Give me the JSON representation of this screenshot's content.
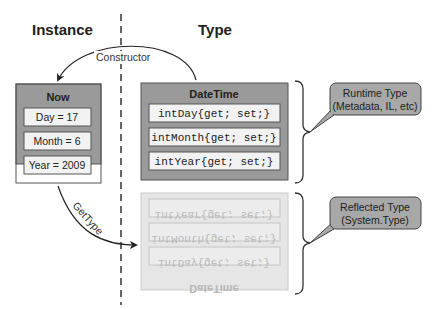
{
  "headers": {
    "instance": "Instance",
    "type": "Type"
  },
  "arrows": {
    "constructor": "Constructor",
    "gettype": "GetType"
  },
  "instance_box": {
    "title": "Now",
    "fields": [
      "Day = 17",
      "Month = 6",
      "Year = 2009"
    ]
  },
  "runtime_box": {
    "title": "DateTime",
    "fields": [
      "intDay{get; set;}",
      "intMonth{get; set;}",
      "intYear{get; set;}"
    ]
  },
  "reflected_box": {
    "title": "DateTime",
    "fields": [
      "intYear{get; set;}",
      "intMonth{get; set;}",
      "intDay{get; set;}"
    ],
    "mirrored": true
  },
  "callouts": {
    "runtime": {
      "line1": "Runtime Type",
      "line2": "(Metadata, IL, etc)"
    },
    "reflected": {
      "line1": "Reflected Type",
      "line2": "(System.Type)"
    }
  },
  "colors": {
    "box_fill": "#9a9a9a",
    "field_fill": "#f2f2f2",
    "callout_fill": "#a8a8a8",
    "ghost_fill": "#e6e6e6"
  }
}
